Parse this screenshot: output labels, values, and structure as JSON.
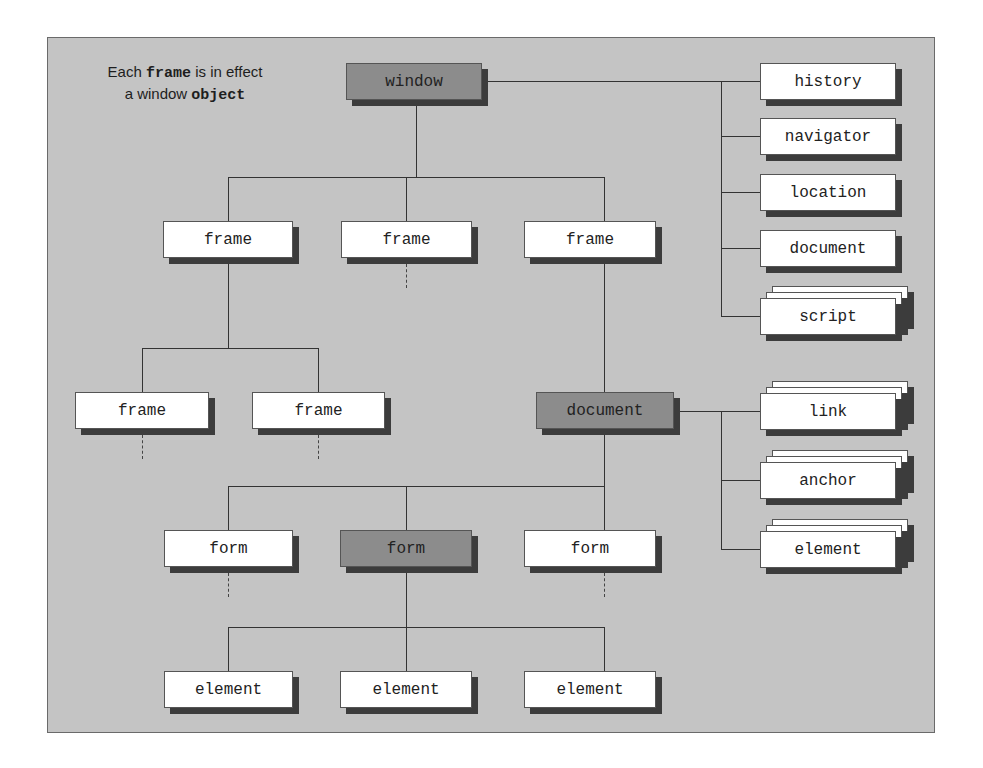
{
  "caption": {
    "line1_pre": "Each ",
    "line1_code": "frame",
    "line1_post": " is in effect",
    "line2_pre": "a window ",
    "line2_code": "object"
  },
  "nodes": {
    "window": "window",
    "frame_left": "frame",
    "frame_middle": "frame",
    "frame_right": "frame",
    "frame_sub_left": "frame",
    "frame_sub_right": "frame",
    "document_main": "document",
    "form_left": "form",
    "form_middle": "form",
    "form_right": "form",
    "element_left": "element",
    "element_middle": "element",
    "element_right": "element"
  },
  "window_children": [
    "history",
    "navigator",
    "location",
    "document",
    "script"
  ],
  "document_children": [
    "link",
    "anchor",
    "element"
  ],
  "colors": {
    "panel": "#c4c4c4",
    "highlight_node": "#8c8c8c",
    "node": "#ffffff",
    "shadow": "#3c3c3c"
  }
}
